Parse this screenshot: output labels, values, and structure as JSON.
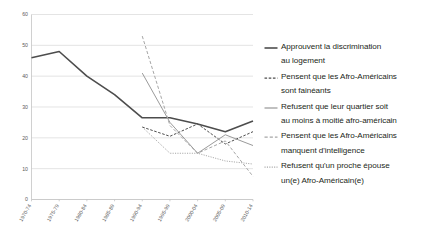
{
  "chart_data": {
    "type": "line",
    "title": "",
    "xlabel": "",
    "ylabel": "",
    "ylim": [
      0,
      60
    ],
    "ytick_values": [
      0,
      10,
      20,
      30,
      40,
      50,
      60
    ],
    "grid": true,
    "legend_position": "right",
    "categories": [
      "1970-74",
      "1975-79",
      "1980-84",
      "1985-89",
      "1990-94",
      "1995-99",
      "2000-04",
      "2005-09",
      "2010-14"
    ],
    "series": [
      {
        "name": "Approuvent la discrimination au logement",
        "legend_lines": [
          "Approuvent la discrimination",
          "au logement"
        ],
        "style": "solid",
        "color": "#4d4d4d",
        "width": 1.6,
        "values": [
          46,
          48,
          40,
          34,
          26.5,
          26.5,
          24.5,
          22,
          25.5
        ]
      },
      {
        "name": "Pensent que les Afro-Américains sont fainéants",
        "legend_lines": [
          "Pensent que les Afro-Américains",
          "sont fainéants"
        ],
        "style": "dashed",
        "color": "#4d4d4d",
        "width": 1.0,
        "values": [
          null,
          null,
          null,
          null,
          23.5,
          20.5,
          24.5,
          18,
          22
        ]
      },
      {
        "name": "Refusent que leur quartier soit au moins à moitié afro-américain",
        "legend_lines": [
          "Refusent que leur quartier soit",
          "au moins à moitié afro-américain"
        ],
        "style": "solid",
        "color": "#9a9a9a",
        "width": 1.0,
        "values": [
          null,
          null,
          null,
          null,
          41,
          25,
          15,
          21,
          17.5
        ]
      },
      {
        "name": "Pensent que les Afro-Américains manquent d'intelligence",
        "legend_lines": [
          "Pensent que les Afro-Américains",
          "manquent d'intelligence"
        ],
        "style": "dashed-gray",
        "color": "#a6a6a6",
        "width": 1.0,
        "values": [
          null,
          null,
          null,
          null,
          53,
          24,
          15,
          19,
          7.5
        ]
      },
      {
        "name": "Refusent qu'un proche épouse un(e) Afro-Américain(e)",
        "legend_lines": [
          "Refusent qu'un proche épouse",
          "un(e) Afro-Américain(e)"
        ],
        "style": "dotted",
        "color": "#a6a6a6",
        "width": 1.0,
        "values": [
          null,
          null,
          null,
          null,
          23.5,
          15,
          15,
          12.5,
          11.5
        ]
      }
    ]
  },
  "colors": {
    "background": "#ffffff",
    "grid": "#d9d9d9",
    "axis": "#c4c4c4",
    "tick_text": "#5a5a5a",
    "legend_text": "#231f20"
  }
}
